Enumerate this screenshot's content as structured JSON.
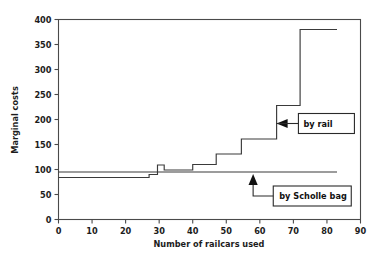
{
  "chart_data": {
    "type": "line",
    "title": "",
    "subtitle": "",
    "xlabel": "Number of railcars used",
    "ylabel": "Marginal costs",
    "xlim": [
      0,
      90
    ],
    "ylim": [
      0,
      400
    ],
    "xticks": [
      0,
      10,
      20,
      30,
      40,
      50,
      60,
      70,
      80,
      90
    ],
    "xticklabels": [
      "0",
      "10",
      "20",
      "30",
      "40",
      "50",
      "60",
      "70",
      "80",
      "90"
    ],
    "yticks": [
      0,
      50,
      100,
      150,
      200,
      250,
      300,
      350,
      400
    ],
    "yticklabels": [
      "0",
      "50",
      "100",
      "150",
      "200",
      "250",
      "300",
      "350",
      "400"
    ],
    "grid": false,
    "legend_position": "none",
    "series": [
      {
        "name": "by rail",
        "type": "step",
        "drawstyle": "steps-post",
        "x": [
          0,
          27,
          27,
          29.5,
          29.5,
          31.5,
          31.5,
          40,
          40,
          47,
          47,
          54.5,
          54.5,
          65,
          65,
          72,
          72,
          83
        ],
        "y": [
          84,
          84,
          90,
          90,
          109,
          109,
          99,
          99,
          110,
          110,
          131,
          131,
          161,
          161,
          228,
          228,
          380,
          380
        ]
      },
      {
        "name": "by Scholle bag",
        "type": "line",
        "x": [
          0,
          83
        ],
        "y": [
          95,
          95
        ]
      }
    ],
    "annotations": [
      {
        "label": "by rail",
        "target_x": 65,
        "target_y": 192,
        "box_x": 71.5,
        "box_y": 192,
        "arrow": "left"
      },
      {
        "label": "by Scholle bag",
        "target_x": 58,
        "target_y": 95,
        "box_x": 64,
        "box_y": 47,
        "arrow": "up"
      }
    ]
  },
  "axes": {
    "x_title": "Number of railcars used",
    "y_title": "Marginal costs"
  },
  "annotations": {
    "rail_label": "by rail",
    "scholle_label": "by Scholle bag"
  },
  "colors": {
    "line": "#3a3a3a",
    "axis": "#4a4a4a",
    "text": "#1c1c1c",
    "background": "#ffffff"
  }
}
